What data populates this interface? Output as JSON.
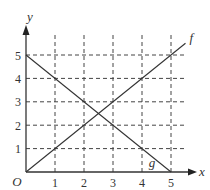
{
  "chart_data": {
    "type": "line",
    "title": "",
    "xlabel": "x",
    "ylabel": "y",
    "origin_label": "O",
    "xlim": [
      0,
      5.5
    ],
    "ylim": [
      0,
      5.5
    ],
    "x_ticks": [
      1,
      2,
      3,
      4,
      5
    ],
    "y_ticks": [
      1,
      2,
      3,
      4,
      5
    ],
    "grid": "dashed",
    "legend": "none",
    "series": [
      {
        "name": "f",
        "label_position": [
          5.6,
          5.7
        ],
        "points": [
          [
            0,
            0
          ],
          [
            5.5,
            5.5
          ]
        ],
        "equation": "y = x"
      },
      {
        "name": "g",
        "label_position": [
          4.2,
          0.35
        ],
        "points": [
          [
            0,
            5
          ],
          [
            5,
            0
          ]
        ],
        "equation": "y = 5 - x"
      }
    ],
    "intersection": [
      2.5,
      2.5
    ]
  }
}
